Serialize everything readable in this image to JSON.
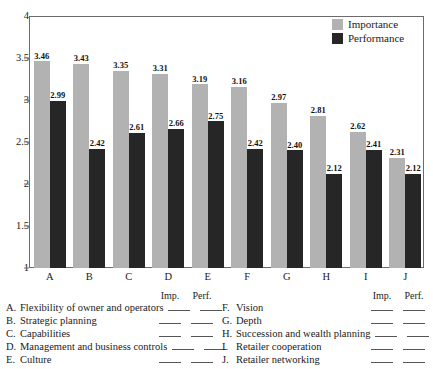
{
  "chart_data": {
    "type": "bar",
    "title": "",
    "subtitle": "",
    "xlabel": "",
    "ylabel": "",
    "ylim": [
      1,
      4
    ],
    "ytick_labels": [
      "4",
      "3.5",
      "3",
      "2.5",
      "2",
      "1.5",
      "1"
    ],
    "yticks": [
      4,
      3.5,
      3,
      2.5,
      2,
      1.5,
      1
    ],
    "grid": false,
    "legend_position": "top-right",
    "categories": [
      "A",
      "B",
      "C",
      "D",
      "E",
      "F",
      "G",
      "H",
      "I",
      "J"
    ],
    "series": [
      {
        "name": "Importance",
        "color": "#b2b2b2",
        "values": [
          3.46,
          3.43,
          3.35,
          3.31,
          3.19,
          3.16,
          2.97,
          2.81,
          2.62,
          2.31
        ],
        "labels": [
          "3.46",
          "3.43",
          "3.35",
          "3.31",
          "3.19",
          "3.16",
          "2.97",
          "2.81",
          "2.62",
          "2.31"
        ]
      },
      {
        "name": "Performance",
        "color": "#262626",
        "values": [
          2.99,
          2.42,
          2.61,
          2.66,
          2.75,
          2.42,
          2.4,
          2.12,
          2.41,
          2.12
        ],
        "labels": [
          "2.99",
          "2.42",
          "2.61",
          "2.66",
          "2.75",
          "2.42",
          "2.40",
          "2.12",
          "2.41",
          "2.12"
        ]
      }
    ]
  },
  "legend": {
    "items": [
      {
        "label": "Importance",
        "color": "#b2b2b2"
      },
      {
        "label": "Performance",
        "color": "#262626"
      }
    ]
  },
  "key": {
    "column_headers": [
      "Imp.",
      "Perf."
    ],
    "left": [
      {
        "letter": "A.",
        "label": "Flexibility of owner and operators",
        "imp": "",
        "perf": ""
      },
      {
        "letter": "B.",
        "label": "Strategic planning",
        "imp": "",
        "perf": ""
      },
      {
        "letter": "C.",
        "label": "Capabilities",
        "imp": "",
        "perf": ""
      },
      {
        "letter": "D.",
        "label": "Management and business controls",
        "imp": "",
        "perf": ""
      },
      {
        "letter": "E.",
        "label": "Culture",
        "imp": "",
        "perf": ""
      }
    ],
    "right": [
      {
        "letter": "F.",
        "label": "Vision",
        "imp": "",
        "perf": ""
      },
      {
        "letter": "G.",
        "label": "Depth",
        "imp": "",
        "perf": ""
      },
      {
        "letter": "H.",
        "label": "Succession and wealth planning",
        "imp": "",
        "perf": ""
      },
      {
        "letter": "I.",
        "label": "Retailer cooperation",
        "imp": "",
        "perf": ""
      },
      {
        "letter": "J.",
        "label": "Retailer networking",
        "imp": "",
        "perf": ""
      }
    ]
  }
}
